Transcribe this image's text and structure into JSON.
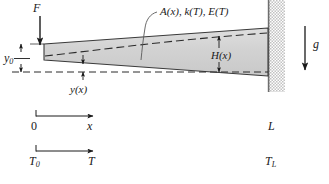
{
  "figure": {
    "kind": "engineering-diagram",
    "width": 329,
    "height": 184
  },
  "labels": {
    "force": "F",
    "tip_deflection": "y",
    "tip_deflection_sub": "0",
    "deflection_curve": "y(x)",
    "beam_properties": "A(x), k(T), E(T)",
    "beam_height": "H(x)",
    "gravity": "g",
    "origin": "0",
    "axis_x": "x",
    "temperature_start": "T",
    "temperature_start_sub": "0",
    "axis_T": "T",
    "length": "L",
    "temperature_end": "T",
    "temperature_end_sub": "L"
  },
  "colors": {
    "beam_fill": "#d4d4d4",
    "beam_stroke": "#3a3a3a",
    "wall_stipple": "#bdbdbd",
    "wall_edge": "#6e6e6e",
    "line": "#1a1a1a",
    "dashed": "#2b2b2b",
    "background": "#ffffff"
  },
  "geometry": {
    "beam_left_x": 44,
    "beam_right_x": 268,
    "beam_left_top_y": 44,
    "beam_left_bottom_y": 60,
    "beam_right_top_y": 28,
    "beam_right_bottom_y": 76,
    "wall_x": 268,
    "wall_width": 17,
    "wall_top_y": 0,
    "wall_bottom_y": 92,
    "force_arrow_x": 40,
    "force_arrow_top_y": 16,
    "force_arrow_bottom_y": 44,
    "gravity_arrow_x": 305,
    "gravity_arrow_top_y": 26,
    "gravity_arrow_bottom_y": 70,
    "reference_line_y": 72,
    "x_axis_y": 116,
    "t_axis_y": 151
  }
}
